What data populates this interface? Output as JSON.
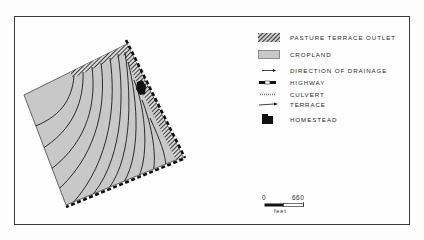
{
  "figure": {
    "type": "farm-field-map",
    "field_corners": {
      "top": [
        127,
        44
      ],
      "left": [
        24,
        95
      ],
      "bottom": [
        66,
        205
      ],
      "right": [
        183,
        157
      ]
    }
  },
  "legend": {
    "items": [
      {
        "symbol": "hatched-box-icon",
        "label": "PASTURE  TERRACE  OUTLET"
      },
      {
        "symbol": "gray-box-icon",
        "label": "CROPLAND"
      },
      {
        "symbol": "arrow-icon",
        "label": "DIRECTION  OF  DRAINAGE"
      },
      {
        "symbol": "highway-icon",
        "label": "HIGHWAY"
      },
      {
        "symbol": "culvert-icon",
        "label": "CULVERT"
      },
      {
        "symbol": "terrace-arrow-icon",
        "label": "TERRACE"
      },
      {
        "symbol": "homestead-icon",
        "label": "HOMESTEAD"
      }
    ]
  },
  "scale_bar": {
    "start_label": "0",
    "end_label": "660",
    "unit": "feet"
  },
  "colors": {
    "cropland": "#c8c8c8",
    "lines": "#1a1a1a",
    "frame": "#3a3a3a"
  }
}
